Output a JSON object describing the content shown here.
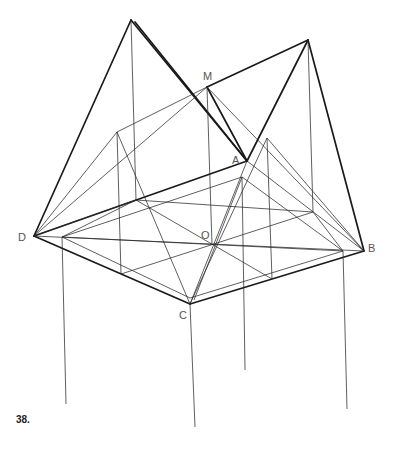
{
  "figure": {
    "caption": "38.",
    "labels": {
      "M": "M",
      "A": "A",
      "O": "O",
      "D": "D",
      "B": "B",
      "C": "C"
    },
    "points": {
      "P1": [
        131,
        20
      ],
      "P2": [
        308,
        40
      ],
      "M": [
        207,
        87
      ],
      "A": [
        247,
        161
      ],
      "D": [
        34,
        236
      ],
      "B": [
        364,
        251
      ],
      "C": [
        190,
        304
      ],
      "O": [
        214,
        245
      ],
      "L1": [
        117,
        132
      ],
      "R1": [
        267,
        138
      ],
      "I1": [
        136,
        200
      ],
      "I2": [
        242,
        177
      ],
      "I3": [
        313,
        212
      ],
      "I4": [
        62,
        237
      ],
      "I5": [
        343,
        251
      ],
      "I6": [
        121,
        274
      ],
      "I7": [
        272,
        279
      ]
    }
  }
}
